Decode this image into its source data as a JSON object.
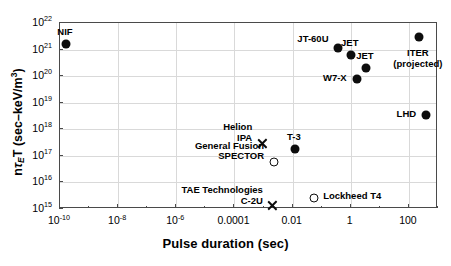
{
  "chart_data": {
    "type": "scatter",
    "title": "",
    "xlabel": "Pulse duration (sec)",
    "ylabel": "nτET (sec-keV/m3)",
    "ylabel_parts": {
      "pre": "n",
      "sub": "E",
      "mid": "T (sec–keV/m",
      "sup": "3",
      "post": ")"
    },
    "xscale": "log",
    "yscale": "log",
    "xlim": [
      1e-10,
      1000
    ],
    "ylim": [
      1000000000000000.0,
      1e+22
    ],
    "grid": true,
    "legend": "none",
    "xticks": [
      {
        "value": 1e-10,
        "label": "10",
        "exp": "-10"
      },
      {
        "value": 1e-08,
        "label": "10",
        "exp": "-8"
      },
      {
        "value": 1e-06,
        "label": "10",
        "exp": "-6"
      },
      {
        "value": 0.0001,
        "label": "0.0001",
        "exp": ""
      },
      {
        "value": 0.01,
        "label": "0.01",
        "exp": ""
      },
      {
        "value": 1,
        "label": "1",
        "exp": ""
      },
      {
        "value": 100,
        "label": "100",
        "exp": ""
      }
    ],
    "yticks": [
      {
        "value": 1e+22,
        "label": "10",
        "exp": "22"
      },
      {
        "value": 1e+21,
        "label": "10",
        "exp": "21"
      },
      {
        "value": 1e+20,
        "label": "10",
        "exp": "20"
      },
      {
        "value": 1e+19,
        "label": "10",
        "exp": "19"
      },
      {
        "value": 1e+18,
        "label": "10",
        "exp": "18"
      },
      {
        "value": 1e+17,
        "label": "10",
        "exp": "17"
      },
      {
        "value": 1e+16,
        "label": "10",
        "exp": "16"
      },
      {
        "value": 1000000000000000.0,
        "label": "10",
        "exp": "15"
      }
    ],
    "points": [
      {
        "name": "NIF",
        "label": "NIF",
        "x": 1.6e-10,
        "y": 1.6e+21,
        "marker": "filled-circle",
        "label_pos": "above",
        "lines": [
          "NIF"
        ]
      },
      {
        "name": "JT-60U",
        "label": "JT-60U",
        "x": 0.35,
        "y": 1.1e+21,
        "marker": "filled-circle",
        "label_pos": "left-above",
        "lines": [
          "JT-60U"
        ]
      },
      {
        "name": "JET",
        "label": "JET",
        "x": 1.0,
        "y": 6e+20,
        "marker": "filled-circle",
        "label_pos": "above",
        "lines": [
          "JET"
        ]
      },
      {
        "name": "JET-long",
        "label": "JET",
        "x": 3.3,
        "y": 2e+20,
        "marker": "filled-circle",
        "label_pos": "above",
        "lines": [
          "JET"
        ]
      },
      {
        "name": "W7-X",
        "label": "W7-X",
        "x": 1.6,
        "y": 7.5e+19,
        "marker": "filled-circle",
        "label_pos": "left",
        "lines": [
          "W7-X"
        ]
      },
      {
        "name": "ITER",
        "label": "ITER (projected)",
        "x": 220,
        "y": 3e+21,
        "marker": "filled-circle",
        "label_pos": "below",
        "lines": [
          "ITER",
          "(projected)"
        ]
      },
      {
        "name": "LHD",
        "label": "LHD",
        "x": 390,
        "y": 3.5e+18,
        "marker": "filled-circle",
        "label_pos": "left",
        "lines": [
          "LHD"
        ]
      },
      {
        "name": "T-3",
        "label": "T-3",
        "x": 0.012,
        "y": 1.8e+17,
        "marker": "filled-circle",
        "label_pos": "above",
        "lines": [
          "T-3"
        ]
      },
      {
        "name": "Helion-IPA",
        "label": "Helion IPA",
        "x": 0.0009,
        "y": 3e+17,
        "marker": "cross",
        "label_pos": "left-stack",
        "lines": [
          "Helion",
          "IPA"
        ]
      },
      {
        "name": "GeneralFusion",
        "label": "General Fusion SPECTOR",
        "x": 0.0023,
        "y": 6e+16,
        "marker": "open-circle",
        "label_pos": "left-stack",
        "lines": [
          "General Fusion",
          "SPECTOR"
        ]
      },
      {
        "name": "TAE-C2U",
        "label": "TAE Technologies C-2U",
        "x": 0.0021,
        "y": 1300000000000000.0,
        "marker": "cross",
        "label_pos": "left-stack",
        "lines": [
          "TAE Technologies",
          "C-2U"
        ]
      },
      {
        "name": "Lockheed-T4",
        "label": "Lockheed T4",
        "x": 0.055,
        "y": 2600000000000000.0,
        "marker": "open-circle",
        "label_pos": "right",
        "lines": [
          "Lockheed T4"
        ]
      }
    ]
  }
}
